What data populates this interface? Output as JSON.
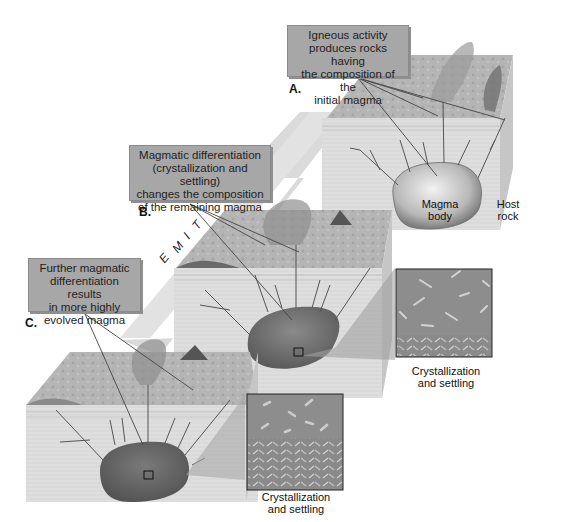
{
  "diagram": {
    "type": "geologic process diagram",
    "stages": [
      {
        "letter": "A.",
        "callout": [
          "Igneous activity",
          "produces rocks having",
          "the composition of the",
          "initial magma"
        ],
        "labels": {
          "magma": [
            "Magma",
            "body"
          ],
          "host": [
            "Host",
            "rock"
          ]
        }
      },
      {
        "letter": "B.",
        "callout": [
          "Magmatic differentiation",
          "(crystallization and settling)",
          "changes the composition",
          "of the remaining magma"
        ],
        "inset_caption": [
          "Crystallization",
          "and settling"
        ]
      },
      {
        "letter": "C.",
        "callout": [
          "Further magmatic",
          "differentiation results",
          "in more highly",
          "evolved magma"
        ],
        "inset_caption": [
          "Crystallization",
          "and settling"
        ]
      }
    ],
    "time_arrow": {
      "letters": [
        "T",
        "I",
        "M",
        "E"
      ]
    },
    "colors": {
      "callout_fill": "#a7a7a7",
      "arrow_fill": "#d8d8d8",
      "block_side": "#dcdcdc",
      "magma_light": "#d0d0d0",
      "magma_dark": "#6a6a6a",
      "inset_fill": "#8c8c8c"
    }
  }
}
